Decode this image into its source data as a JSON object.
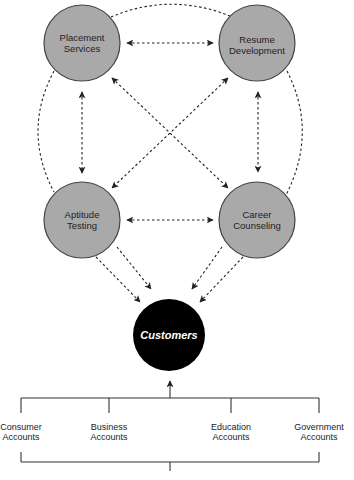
{
  "diagram": {
    "colors": {
      "service_fill": "#a9a9a9",
      "service_stroke": "#444444",
      "customer_fill": "#000000",
      "customer_text": "#ffffff",
      "line": "#222222"
    },
    "services": [
      {
        "id": "placement",
        "line1": "Placement",
        "line2": "Services",
        "cx": 82,
        "cy": 43
      },
      {
        "id": "resume",
        "line1": "Resume",
        "line2": "Development",
        "cx": 257,
        "cy": 43
      },
      {
        "id": "aptitude",
        "line1": "Aptitude",
        "line2": "Testing",
        "cx": 82,
        "cy": 220
      },
      {
        "id": "career",
        "line1": "Career",
        "line2": "Counseling",
        "cx": 257,
        "cy": 220
      }
    ],
    "customers": {
      "label": "Customers",
      "cx": 169,
      "cy": 336
    },
    "accounts": [
      {
        "line1": "Consumer",
        "line2": "Accounts"
      },
      {
        "line1": "Business",
        "line2": "Accounts"
      },
      {
        "line1": "Education",
        "line2": "Accounts"
      },
      {
        "line1": "Government",
        "line2": "Accounts"
      }
    ]
  }
}
